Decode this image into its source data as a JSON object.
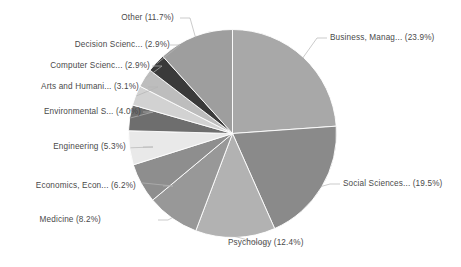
{
  "chart_data": {
    "type": "pie",
    "title": "",
    "subtitle": "",
    "xlabel": "",
    "ylabel": "",
    "legend_position": "none",
    "grid": false,
    "labels_show_percent": true,
    "start_angle_deg": 0,
    "direction": "clockwise",
    "categories": [
      "Business, Manag...",
      "Social Sciences...",
      "Psychology",
      "Medicine",
      "Economics, Econ...",
      "Engineering",
      "Environmental S...",
      "Arts and Humani...",
      "Computer Scienc...",
      "Decision Scienc...",
      "Other"
    ],
    "values": [
      23.9,
      19.5,
      12.4,
      8.2,
      6.2,
      5.3,
      4.0,
      3.1,
      2.9,
      2.9,
      11.7
    ],
    "colors": [
      "#a8a8a8",
      "#8a8a8a",
      "#b2b2b2",
      "#989898",
      "#8e8e8e",
      "#e9e9e9",
      "#6e6e6e",
      "#d2d2d2",
      "#bdbdbd",
      "#3a3a3a",
      "#9e9e9e"
    ],
    "slices": [
      {
        "label": "Business, Manag... (23.9%)",
        "name": "Business, Manag...",
        "value": 23.9,
        "color": "#a8a8a8"
      },
      {
        "label": "Social Sciences... (19.5%)",
        "name": "Social Sciences...",
        "value": 19.5,
        "color": "#8a8a8a"
      },
      {
        "label": "Psychology (12.4%)",
        "name": "Psychology",
        "value": 12.4,
        "color": "#b2b2b2"
      },
      {
        "label": "Medicine (8.2%)",
        "name": "Medicine",
        "value": 8.2,
        "color": "#989898"
      },
      {
        "label": "Economics, Econ... (6.2%)",
        "name": "Economics, Econ...",
        "value": 6.2,
        "color": "#8e8e8e"
      },
      {
        "label": "Engineering (5.3%)",
        "name": "Engineering",
        "value": 5.3,
        "color": "#e9e9e9"
      },
      {
        "label": "Environmental S... (4.0%)",
        "name": "Environmental S...",
        "value": 4.0,
        "color": "#6e6e6e"
      },
      {
        "label": "Arts and Humani... (3.1%)",
        "name": "Arts and Humani...",
        "value": 3.1,
        "color": "#d2d2d2"
      },
      {
        "label": "Computer Scienc... (2.9%)",
        "name": "Computer Scienc...",
        "value": 2.9,
        "color": "#bdbdbd"
      },
      {
        "label": "Decision Scienc... (2.9%)",
        "name": "Decision Scienc...",
        "value": 2.9,
        "color": "#3a3a3a"
      },
      {
        "label": "Other (11.7%)",
        "name": "Other",
        "value": 11.7,
        "color": "#9e9e9e"
      }
    ]
  },
  "figure": {
    "background": "#ffffff",
    "label_color": "#4a4a4a",
    "leader_color": "#b5b5b5",
    "slice_border_color": "#ffffff"
  }
}
